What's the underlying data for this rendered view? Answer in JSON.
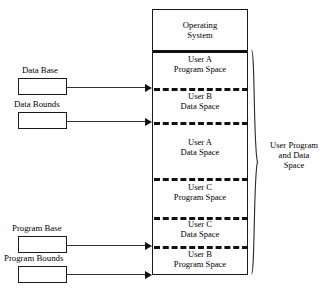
{
  "diagram": {
    "memory_column": {
      "os_region": {
        "label_line1": "Operating",
        "label_line2": "System"
      },
      "user_regions": [
        {
          "id": "user-a-program-space",
          "line1": "User A",
          "line2": "Program Space"
        },
        {
          "id": "user-b-data-space",
          "line1": "User B",
          "line2": "Data Space"
        },
        {
          "id": "user-a-data-space",
          "line1": "User A",
          "line2": "Data Space"
        },
        {
          "id": "user-c-program-space",
          "line1": "User C",
          "line2": "Program Space"
        },
        {
          "id": "user-c-data-space",
          "line1": "User C",
          "line2": "Data Space"
        },
        {
          "id": "user-b-program-space",
          "line1": "User B",
          "line2": "Program Space"
        }
      ]
    },
    "registers": [
      {
        "id": "data-base",
        "label": "Data Base"
      },
      {
        "id": "data-bounds",
        "label": "Data Bounds"
      },
      {
        "id": "program-base",
        "label": "Program Base"
      },
      {
        "id": "program-bounds",
        "label": "Program Bounds"
      }
    ],
    "brace_label": {
      "line1": "User Program",
      "line2": "and Data",
      "line3": "Space"
    },
    "caption": "",
    "colors": {
      "stroke": "#1a1a1a",
      "dash": "#111111",
      "background": "#ffffff",
      "text": "#000000"
    }
  }
}
